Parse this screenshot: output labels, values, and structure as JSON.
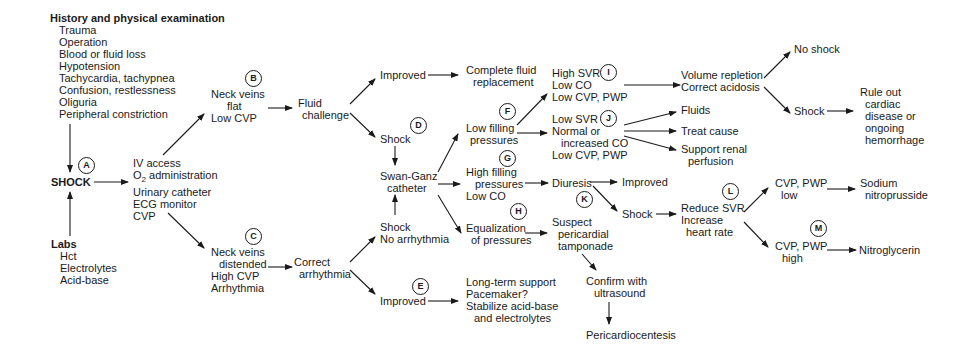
{
  "history": {
    "title": "History and physical examination",
    "items": [
      "Trauma",
      "Operation",
      "Blood or fluid loss",
      "Hypotension",
      "Tachycardia, tachypnea",
      "Confusion, restlessness",
      "Oliguria",
      "Peripheral constriction"
    ]
  },
  "shock": {
    "label": "SHOCK",
    "marker": "A"
  },
  "labs": {
    "title": "Labs",
    "items": [
      "Hct",
      "Electrolytes",
      "Acid-base"
    ]
  },
  "initial": {
    "lines": [
      "IV access",
      "O",
      "2",
      " administration",
      "Urinary catheter",
      "ECG monitor",
      "CVP"
    ]
  },
  "flat": {
    "marker": "B",
    "lines": [
      "Neck veins",
      "flat",
      "Low CVP"
    ]
  },
  "distended": {
    "marker": "C",
    "lines": [
      "Neck veins",
      "distended",
      "High CVP",
      "Arrhythmia"
    ]
  },
  "fluid_challenge": {
    "lines": [
      "Fluid",
      "challenge"
    ]
  },
  "correct_arrhythmia": {
    "lines": [
      "Correct",
      "arrhythmia"
    ]
  },
  "improved_1": {
    "label": "Improved"
  },
  "complete_fluid": {
    "lines": [
      "Complete fluid",
      "replacement"
    ]
  },
  "shock_d": {
    "label": "Shock",
    "marker": "D"
  },
  "swan_ganz": {
    "lines": [
      "Swan-Ganz",
      "catheter"
    ]
  },
  "shock_no_arr": {
    "lines": [
      "Shock",
      "No arrhythmia"
    ]
  },
  "improved_e": {
    "label": "Improved",
    "marker": "E"
  },
  "long_term": {
    "lines": [
      "Long-term support",
      "Pacemaker?",
      "Stabilize acid-base",
      "and electrolytes"
    ]
  },
  "low_filling": {
    "marker": "F",
    "lines": [
      "Low filling",
      "pressures"
    ]
  },
  "high_filling": {
    "marker": "G",
    "lines": [
      "High filling",
      "pressures",
      "Low CO"
    ]
  },
  "equalization": {
    "marker": "H",
    "lines": [
      "Equalization",
      "of pressures"
    ]
  },
  "high_svr": {
    "marker": "I",
    "lines": [
      "High SVR",
      "Low CO",
      "Low CVP, PWP"
    ]
  },
  "low_svr": {
    "marker": "J",
    "lines": [
      "Low SVR",
      "Normal or",
      "increased CO",
      "Low CVP, PWP"
    ]
  },
  "diuresis": {
    "label": "Diuresis",
    "marker": "K"
  },
  "improved_2": {
    "label": "Improved"
  },
  "shock_k": {
    "label": "Shock"
  },
  "tamponade": {
    "lines": [
      "Suspect",
      "pericardial",
      "tamponade"
    ]
  },
  "confirm": {
    "lines": [
      "Confirm with",
      "ultrasound"
    ]
  },
  "pericardiocentesis": {
    "label": "Pericardiocentesis"
  },
  "volume_repletion": {
    "lines": [
      "Volume repletion",
      "Correct acidosis"
    ]
  },
  "no_shock": {
    "label": "No shock"
  },
  "shock_final": {
    "label": "Shock"
  },
  "rule_out": {
    "lines": [
      "Rule out",
      "cardiac",
      "disease or",
      "ongoing",
      "hemorrhage"
    ]
  },
  "fluids": {
    "label": "Fluids"
  },
  "treat_cause": {
    "label": "Treat cause"
  },
  "support_renal": {
    "lines": [
      "Support renal",
      "perfusion"
    ]
  },
  "reduce_svr": {
    "marker": "L",
    "lines": [
      "Reduce SVR",
      "Increase",
      "heart rate"
    ]
  },
  "cvp_low": {
    "lines": [
      "CVP, PWP",
      "low"
    ]
  },
  "cvp_high": {
    "marker": "M",
    "lines": [
      "CVP, PWP",
      "high"
    ]
  },
  "sodium_nitro": {
    "lines": [
      "Sodium",
      "nitroprusside"
    ]
  },
  "nitroglycerin": {
    "label": "Nitroglycerin"
  },
  "colors": {
    "ink": "#1a1a1a",
    "background": "#ffffff"
  }
}
